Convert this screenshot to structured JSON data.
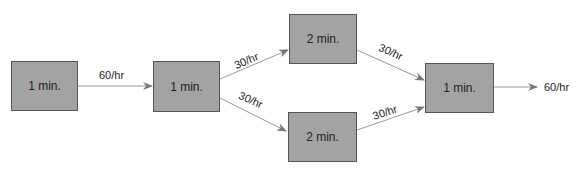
{
  "diagram": {
    "type": "process-flow",
    "stations": [
      {
        "id": "s1",
        "label": "1 min."
      },
      {
        "id": "s2",
        "label": "1 min."
      },
      {
        "id": "s3",
        "label": "2 min."
      },
      {
        "id": "s4",
        "label": "2 min."
      },
      {
        "id": "s5",
        "label": "1 min."
      }
    ],
    "flows": [
      {
        "from": "s1",
        "to": "s2",
        "label": "60/hr"
      },
      {
        "from": "s2",
        "to": "s3",
        "label": "30/hr"
      },
      {
        "from": "s2",
        "to": "s4",
        "label": "30/hr"
      },
      {
        "from": "s3",
        "to": "s5",
        "label": "30/hr"
      },
      {
        "from": "s4",
        "to": "s5",
        "label": "30/hr"
      },
      {
        "from": "s5",
        "to": "out",
        "label": "60/hr"
      }
    ],
    "colors": {
      "box_fill": "#a3a3a3",
      "box_border": "#555555",
      "arrow": "#888888"
    }
  }
}
